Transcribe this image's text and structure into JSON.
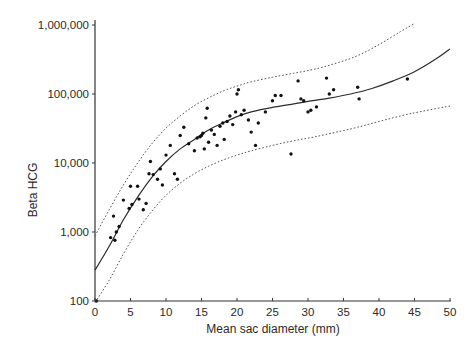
{
  "chart_data": {
    "type": "scatter",
    "title": "",
    "xlabel": "Mean sac diameter (mm)",
    "ylabel": "Beta HCG",
    "xlim": [
      0,
      50
    ],
    "ylim": [
      100,
      1000000
    ],
    "yscale": "log",
    "grid": false,
    "legend": null,
    "x_ticks": [
      0,
      5,
      10,
      15,
      20,
      25,
      30,
      35,
      40,
      45,
      50
    ],
    "x_tick_labels": [
      "0",
      "5",
      "10",
      "15",
      "20",
      "25",
      "30",
      "35",
      "40",
      "45",
      "50"
    ],
    "y_ticks": [
      100,
      1000,
      10000,
      100000,
      1000000
    ],
    "y_tick_labels": [
      "100",
      "1,000",
      "10,000",
      "100,000",
      "1,000,000"
    ],
    "series": [
      {
        "name": "Observations",
        "kind": "scatter",
        "points": [
          [
            0.2,
            100
          ],
          [
            2.2,
            830
          ],
          [
            2.6,
            1700
          ],
          [
            2.8,
            760
          ],
          [
            3.0,
            1000
          ],
          [
            3.4,
            1200
          ],
          [
            4.0,
            2900
          ],
          [
            4.8,
            2200
          ],
          [
            5.0,
            4600
          ],
          [
            5.2,
            2500
          ],
          [
            6.0,
            4600
          ],
          [
            6.2,
            3000
          ],
          [
            6.8,
            2100
          ],
          [
            7.2,
            2600
          ],
          [
            7.6,
            7000
          ],
          [
            7.8,
            10500
          ],
          [
            8.2,
            6800
          ],
          [
            8.8,
            5800
          ],
          [
            9.2,
            8200
          ],
          [
            9.5,
            4800
          ],
          [
            10.0,
            13000
          ],
          [
            10.6,
            18000
          ],
          [
            11.2,
            7000
          ],
          [
            11.6,
            5800
          ],
          [
            12.0,
            25000
          ],
          [
            12.5,
            33000
          ],
          [
            13.2,
            19000
          ],
          [
            14.0,
            15000
          ],
          [
            14.4,
            23000
          ],
          [
            14.8,
            24000
          ],
          [
            15.0,
            25000
          ],
          [
            15.2,
            27000
          ],
          [
            15.4,
            16000
          ],
          [
            15.6,
            45000
          ],
          [
            15.8,
            62000
          ],
          [
            16.0,
            20000
          ],
          [
            16.4,
            30000
          ],
          [
            16.8,
            26000
          ],
          [
            17.2,
            18000
          ],
          [
            17.6,
            34000
          ],
          [
            18.0,
            38000
          ],
          [
            18.2,
            22000
          ],
          [
            18.6,
            40000
          ],
          [
            19.0,
            48000
          ],
          [
            19.4,
            36000
          ],
          [
            19.8,
            55000
          ],
          [
            20.0,
            100000
          ],
          [
            20.2,
            115000
          ],
          [
            20.6,
            50000
          ],
          [
            21.0,
            58000
          ],
          [
            21.6,
            42000
          ],
          [
            22.0,
            28000
          ],
          [
            22.6,
            18000
          ],
          [
            23.0,
            38000
          ],
          [
            24.0,
            55000
          ],
          [
            25.0,
            80000
          ],
          [
            25.4,
            95000
          ],
          [
            26.2,
            95000
          ],
          [
            27.6,
            13500
          ],
          [
            28.6,
            155000
          ],
          [
            29.0,
            85000
          ],
          [
            29.4,
            80000
          ],
          [
            30.0,
            55000
          ],
          [
            30.4,
            58000
          ],
          [
            31.2,
            65000
          ],
          [
            32.6,
            170000
          ],
          [
            33.0,
            100000
          ],
          [
            33.6,
            115000
          ],
          [
            37.0,
            125000
          ],
          [
            37.2,
            85000
          ],
          [
            44.0,
            165000
          ]
        ]
      },
      {
        "name": "Regression fit",
        "kind": "line",
        "style": "solid",
        "points": [
          [
            0,
            280
          ],
          [
            2,
            620
          ],
          [
            4,
            1500
          ],
          [
            6,
            3200
          ],
          [
            8,
            6200
          ],
          [
            10,
            10500
          ],
          [
            12,
            16000
          ],
          [
            14,
            22000
          ],
          [
            16,
            30000
          ],
          [
            18,
            38000
          ],
          [
            20,
            47000
          ],
          [
            22,
            55000
          ],
          [
            25,
            64000
          ],
          [
            28,
            72000
          ],
          [
            30,
            78000
          ],
          [
            33,
            87000
          ],
          [
            36,
            100000
          ],
          [
            39,
            120000
          ],
          [
            42,
            155000
          ],
          [
            45,
            210000
          ],
          [
            48,
            320000
          ],
          [
            50,
            450000
          ]
        ]
      },
      {
        "name": "Upper confidence limit",
        "kind": "line",
        "style": "dotted",
        "points": [
          [
            0,
            880
          ],
          [
            2,
            2100
          ],
          [
            4,
            4800
          ],
          [
            6,
            10000
          ],
          [
            8,
            19000
          ],
          [
            10,
            32000
          ],
          [
            12,
            48000
          ],
          [
            14,
            68000
          ],
          [
            16,
            88000
          ],
          [
            18,
            110000
          ],
          [
            20,
            130000
          ],
          [
            22,
            150000
          ],
          [
            25,
            175000
          ],
          [
            28,
            200000
          ],
          [
            31,
            230000
          ],
          [
            34,
            280000
          ],
          [
            37,
            360000
          ],
          [
            40,
            520000
          ],
          [
            43,
            800000
          ],
          [
            45,
            1050000
          ]
        ]
      },
      {
        "name": "Lower confidence limit",
        "kind": "line",
        "style": "dotted",
        "points": [
          [
            0,
            95
          ],
          [
            2,
            200
          ],
          [
            4,
            480
          ],
          [
            6,
            1050
          ],
          [
            8,
            2000
          ],
          [
            10,
            3400
          ],
          [
            12,
            5100
          ],
          [
            14,
            7000
          ],
          [
            16,
            9000
          ],
          [
            18,
            11000
          ],
          [
            20,
            13000
          ],
          [
            22,
            15000
          ],
          [
            25,
            18000
          ],
          [
            28,
            21000
          ],
          [
            31,
            24000
          ],
          [
            34,
            28000
          ],
          [
            37,
            33000
          ],
          [
            40,
            40000
          ],
          [
            43,
            48000
          ],
          [
            46,
            56000
          ],
          [
            50,
            67000
          ]
        ]
      }
    ]
  }
}
